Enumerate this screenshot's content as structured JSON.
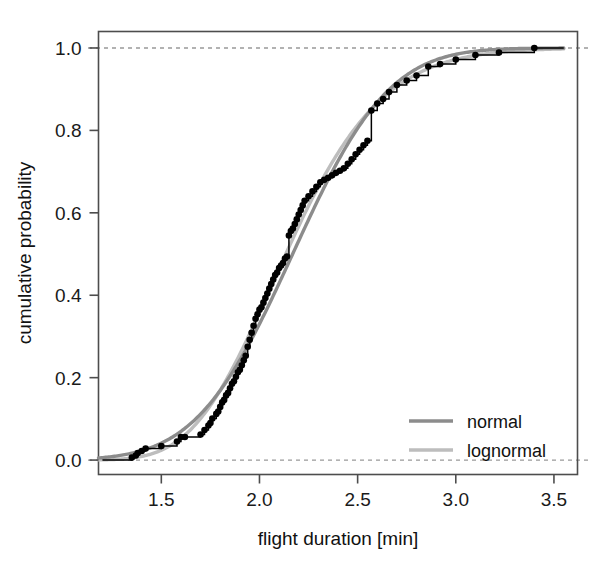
{
  "chart_data": {
    "type": "line",
    "title": "",
    "subtitle": "",
    "xlabel": "flight duration [min]",
    "ylabel": "cumulative probability",
    "xlim": [
      1.18,
      3.62
    ],
    "ylim": [
      -0.035,
      1.04
    ],
    "xticks": [
      1.5,
      2.0,
      2.5,
      3.0,
      3.5
    ],
    "xticklabels": [
      "1.5",
      "2.0",
      "2.5",
      "3.0",
      "3.5"
    ],
    "yticks": [
      0.0,
      0.2,
      0.4,
      0.6,
      0.8,
      1.0
    ],
    "yticklabels": [
      "0.0",
      "0.2",
      "0.4",
      "0.6",
      "0.8",
      "1.0"
    ],
    "grid": false,
    "reference_lines": [
      {
        "type": "hline",
        "y": 0.0,
        "style": "dashed",
        "color": "#999999"
      },
      {
        "type": "hline",
        "y": 1.0,
        "style": "dashed",
        "color": "#999999"
      }
    ],
    "legend": {
      "position": "bottom-right",
      "entries": [
        {
          "name": "normal",
          "color": "#8c8c8c",
          "style": "solid"
        },
        {
          "name": "lognormal",
          "color": "#bdbdbd",
          "style": "solid"
        }
      ]
    },
    "series": [
      {
        "name": "empirical",
        "type": "step-points",
        "color": "#000000",
        "marker": "filled-circle",
        "x": [
          1.35,
          1.37,
          1.38,
          1.4,
          1.42,
          1.5,
          1.58,
          1.6,
          1.62,
          1.7,
          1.72,
          1.74,
          1.75,
          1.76,
          1.78,
          1.79,
          1.8,
          1.81,
          1.82,
          1.83,
          1.84,
          1.85,
          1.86,
          1.87,
          1.88,
          1.89,
          1.9,
          1.91,
          1.92,
          1.93,
          1.94,
          1.95,
          1.96,
          1.97,
          1.98,
          1.99,
          2.0,
          2.01,
          2.02,
          2.03,
          2.04,
          2.05,
          2.06,
          2.07,
          2.08,
          2.09,
          2.1,
          2.11,
          2.12,
          2.13,
          2.14,
          2.15,
          2.16,
          2.17,
          2.18,
          2.19,
          2.2,
          2.21,
          2.22,
          2.23,
          2.25,
          2.27,
          2.29,
          2.31,
          2.33,
          2.35,
          2.37,
          2.39,
          2.41,
          2.43,
          2.45,
          2.47,
          2.49,
          2.51,
          2.53,
          2.55,
          2.57,
          2.6,
          2.63,
          2.66,
          2.7,
          2.75,
          2.8,
          2.86,
          2.92,
          3.0,
          3.1,
          3.22,
          3.4
        ],
        "y": [
          0.006,
          0.011,
          0.017,
          0.022,
          0.028,
          0.034,
          0.045,
          0.056,
          0.056,
          0.062,
          0.073,
          0.084,
          0.09,
          0.101,
          0.112,
          0.118,
          0.129,
          0.14,
          0.146,
          0.157,
          0.163,
          0.174,
          0.185,
          0.191,
          0.202,
          0.213,
          0.219,
          0.23,
          0.242,
          0.253,
          0.275,
          0.292,
          0.309,
          0.326,
          0.343,
          0.354,
          0.365,
          0.371,
          0.382,
          0.393,
          0.404,
          0.416,
          0.427,
          0.438,
          0.449,
          0.455,
          0.466,
          0.472,
          0.478,
          0.489,
          0.494,
          0.545,
          0.556,
          0.562,
          0.573,
          0.584,
          0.596,
          0.607,
          0.618,
          0.629,
          0.64,
          0.652,
          0.663,
          0.674,
          0.68,
          0.685,
          0.691,
          0.697,
          0.702,
          0.708,
          0.719,
          0.73,
          0.742,
          0.753,
          0.764,
          0.775,
          0.848,
          0.865,
          0.876,
          0.893,
          0.91,
          0.921,
          0.933,
          0.955,
          0.961,
          0.972,
          0.983,
          0.989,
          1.0
        ]
      },
      {
        "name": "normal",
        "type": "fitted-cdf",
        "distribution": "normal",
        "mean": 2.169,
        "sd": 0.385,
        "color": "#8c8c8c",
        "xrange": [
          1.18,
          3.55
        ]
      },
      {
        "name": "lognormal",
        "type": "fitted-cdf",
        "distribution": "lognormal",
        "meanlog": 0.758,
        "sdlog": 0.178,
        "color": "#bdbdbd",
        "xrange": [
          1.18,
          3.55
        ]
      }
    ]
  },
  "axes": {
    "x_axis_name": "flight duration [min]",
    "y_axis_name": "cumulative probability"
  },
  "colors": {
    "normal_line": "#8c8c8c",
    "lognormal_line": "#bdbdbd",
    "empirical": "#000000",
    "frame": "#4d4d4d",
    "reference_dash": "#a0a0a0"
  }
}
